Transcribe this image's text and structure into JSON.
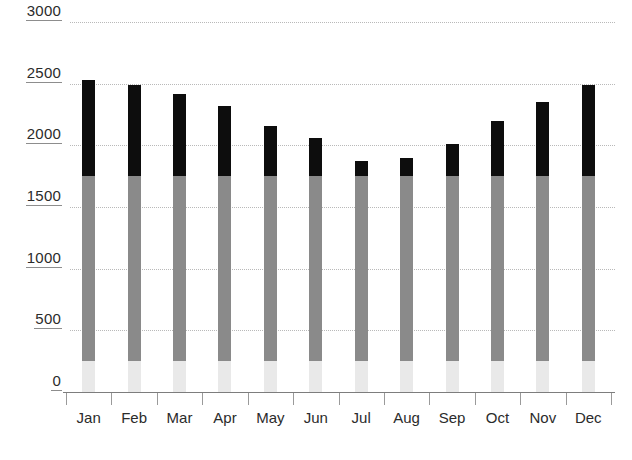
{
  "chart_data": {
    "type": "bar",
    "subtype": "stacked-bar",
    "title": "",
    "subtitle": "",
    "xlabel": "",
    "ylabel": "",
    "categories": [
      "Jan",
      "Feb",
      "Mar",
      "Apr",
      "May",
      "Jun",
      "Jul",
      "Aug",
      "Sep",
      "Oct",
      "Nov",
      "Dec"
    ],
    "ylim": [
      0,
      3000
    ],
    "yticks": [
      0,
      500,
      1000,
      1500,
      2000,
      2500,
      3000
    ],
    "ytick_labels": [
      "0",
      "500",
      "1000",
      "1500",
      "2000",
      "2500",
      "3000"
    ],
    "grid": true,
    "grid_style": "dotted",
    "legend": "none",
    "series": [
      {
        "name": "bottom-segment",
        "color": "#e9e9e9",
        "values": [
          250,
          250,
          250,
          250,
          250,
          250,
          250,
          250,
          250,
          250,
          250,
          250
        ]
      },
      {
        "name": "middle-segment",
        "color": "#8a8a8a",
        "values": [
          1500,
          1500,
          1500,
          1500,
          1500,
          1500,
          1500,
          1500,
          1500,
          1500,
          1500,
          1500
        ]
      },
      {
        "name": "top-segment",
        "color": "#0d0d0d",
        "values": [
          780,
          740,
          670,
          570,
          410,
          310,
          120,
          150,
          260,
          450,
          600,
          740
        ]
      }
    ],
    "totals": [
      2530,
      2490,
      2420,
      2320,
      2160,
      2060,
      1810,
      1900,
      2010,
      2200,
      2350,
      2490
    ],
    "stack_boundaries": {
      "bottom_top": 250,
      "middle_top": 1750
    }
  },
  "axes": {
    "y_axis_ticks": [
      {
        "label": "3000",
        "value": 3000
      },
      {
        "label": "2500",
        "value": 2500
      },
      {
        "label": "2000",
        "value": 2000
      },
      {
        "label": "1500",
        "value": 1500
      },
      {
        "label": "1000",
        "value": 1000
      },
      {
        "label": "500",
        "value": 500
      },
      {
        "label": "0",
        "value": 0
      }
    ],
    "x_axis_labels": [
      "Jan",
      "Feb",
      "Mar",
      "Apr",
      "May",
      "Jun",
      "Jul",
      "Aug",
      "Sep",
      "Oct",
      "Nov",
      "Dec"
    ]
  },
  "colors": {
    "bar_top": "#0d0d0d",
    "bar_middle": "#8a8a8a",
    "bar_bottom": "#e9e9e9",
    "gridline": "#b9b9b9",
    "axis": "#7d7d7d",
    "text": "#2b2b2b",
    "background": "#ffffff"
  }
}
